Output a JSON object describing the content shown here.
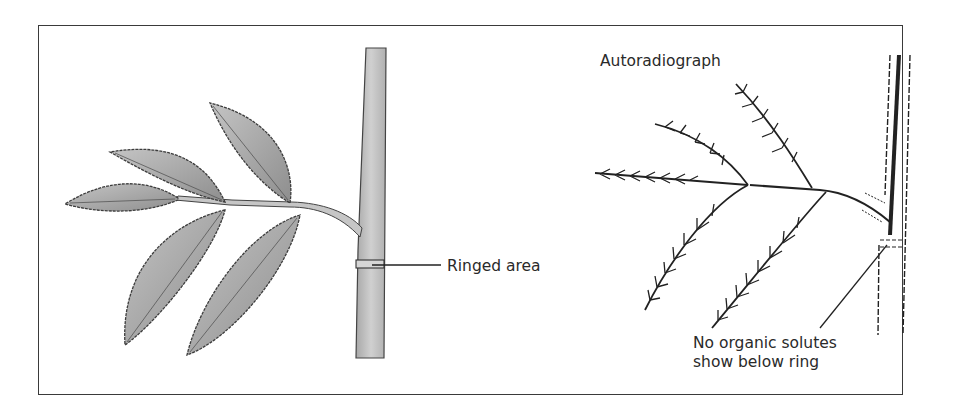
{
  "figure": {
    "left_panel": {
      "title": "Ringed stem with compound leaf",
      "label_ringed_area": "Ringed area"
    },
    "right_panel": {
      "label_autoradiograph": "Autoradiograph",
      "label_no_solutes_line1": "No organic solutes",
      "label_no_solutes_line2": "show below ring"
    },
    "colors": {
      "frame": "#3a3a3a",
      "leaf_fill": "#b4b4b4",
      "leaf_edge": "#3c3c3c",
      "stem_fill": "#c8c8c8",
      "ink": "#222222"
    }
  }
}
